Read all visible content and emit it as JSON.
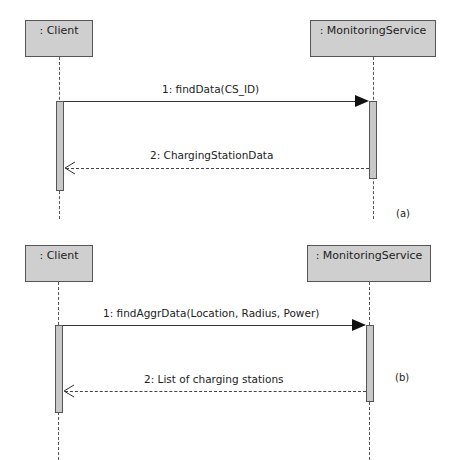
{
  "diagram_type": "UML sequence diagram",
  "panels": [
    {
      "id": "a",
      "caption": "(a)",
      "lifelines": [
        {
          "name": ": Client"
        },
        {
          "name": ": MonitoringService"
        }
      ],
      "messages": [
        {
          "label": "1: findData(CS_ID)",
          "from": ": Client",
          "to": ": MonitoringService",
          "kind": "synchronous call"
        },
        {
          "label": "2: ChargingStationData",
          "from": ": MonitoringService",
          "to": ": Client",
          "kind": "reply"
        }
      ]
    },
    {
      "id": "b",
      "caption": "(b)",
      "lifelines": [
        {
          "name": ": Client"
        },
        {
          "name": ": MonitoringService"
        }
      ],
      "messages": [
        {
          "label": "1: findAggrData(Location, Radius, Power)",
          "from": ": Client",
          "to": ": MonitoringService",
          "kind": "synchronous call"
        },
        {
          "label": "2: List of charging stations",
          "from": ": MonitoringService",
          "to": ": Client",
          "kind": "reply"
        }
      ]
    }
  ],
  "colors": {
    "box_fill": "#cfcfcf",
    "line": "#333333",
    "background": "#ffffff"
  }
}
